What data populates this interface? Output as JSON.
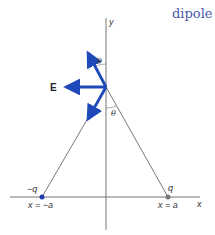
{
  "title": "dipole",
  "diagram": {
    "axes": {
      "x_label": "x",
      "y_label": "y"
    },
    "charges": [
      {
        "label": "−q",
        "position_label": "x = −a",
        "color": "#1f3fb0"
      },
      {
        "label": "q",
        "position_label": "x = a",
        "color": "#777777"
      }
    ],
    "field_label": "E",
    "angle_label": "θ",
    "colors": {
      "arrow": "#1f48b8",
      "line": "#555555"
    }
  }
}
